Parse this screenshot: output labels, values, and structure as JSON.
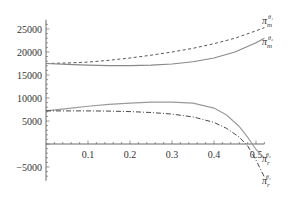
{
  "chart_data": {
    "type": "line",
    "title": "",
    "xlabel": "",
    "ylabel": "",
    "xlim": [
      0,
      0.52
    ],
    "ylim": [
      -8000,
      27000
    ],
    "grid": false,
    "x_ticks": [
      "0.1",
      "0.2",
      "0.3",
      "0.4",
      "0.5"
    ],
    "y_ticks": [
      "25000",
      "20000",
      "15000",
      "10000",
      "5000",
      "-5000"
    ],
    "series": [
      {
        "name": "π_m^{θ1}",
        "label_main": "π",
        "label_sub": "m",
        "label_sup": "θ1",
        "style": "dashed",
        "color": "#444444",
        "x": [
          0,
          0.05,
          0.1,
          0.15,
          0.2,
          0.25,
          0.3,
          0.35,
          0.4,
          0.45,
          0.5,
          0.52
        ],
        "values": [
          17500,
          17600,
          17800,
          18200,
          18700,
          19300,
          20000,
          20800,
          21800,
          23000,
          24600,
          25300
        ]
      },
      {
        "name": "π_m^{θ2}",
        "label_main": "π",
        "label_sub": "m",
        "label_sup": "θ2",
        "style": "solid",
        "color": "#888888",
        "x": [
          0,
          0.05,
          0.1,
          0.15,
          0.2,
          0.25,
          0.3,
          0.35,
          0.4,
          0.45,
          0.5,
          0.52
        ],
        "values": [
          17500,
          17300,
          17150,
          17050,
          17050,
          17150,
          17400,
          17900,
          18700,
          20000,
          22000,
          23000
        ]
      },
      {
        "name": "π_r^{θ2}",
        "label_main": "π",
        "label_sub": "r",
        "label_sup": "θ2",
        "style": "solid",
        "color": "#999999",
        "x": [
          0,
          0.05,
          0.1,
          0.15,
          0.2,
          0.25,
          0.3,
          0.35,
          0.4,
          0.43,
          0.46,
          0.48,
          0.5,
          0.52
        ],
        "values": [
          7200,
          7700,
          8200,
          8600,
          8900,
          9100,
          9100,
          8900,
          7800,
          6300,
          3800,
          1500,
          -1200,
          -3000
        ]
      },
      {
        "name": "π_r^{θ1}",
        "label_main": "π",
        "label_sub": "r",
        "label_sup": "θ1",
        "style": "dashdot",
        "color": "#333333",
        "x": [
          0,
          0.05,
          0.1,
          0.15,
          0.2,
          0.25,
          0.3,
          0.35,
          0.4,
          0.43,
          0.46,
          0.48,
          0.5,
          0.52
        ],
        "values": [
          7200,
          7200,
          7200,
          7150,
          7050,
          6850,
          6500,
          5900,
          4700,
          3400,
          1500,
          -400,
          -3500,
          -7200
        ]
      }
    ]
  }
}
